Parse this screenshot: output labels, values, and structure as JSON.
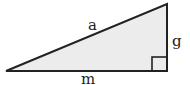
{
  "diagram": {
    "type": "right-triangle",
    "labels": {
      "hypotenuse": "a",
      "vertical_leg": "g",
      "horizontal_leg": "m"
    },
    "colors": {
      "fill": "#ececec",
      "stroke": "#222222"
    },
    "right_angle_marker": true
  }
}
